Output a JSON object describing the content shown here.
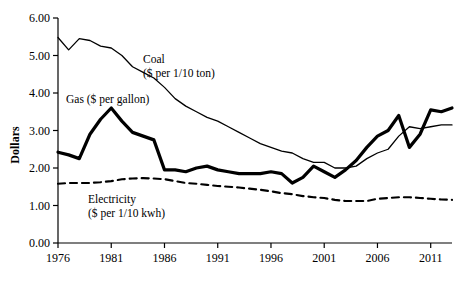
{
  "chart_data": {
    "type": "line",
    "title": "",
    "xlabel": "",
    "ylabel": "Dollars",
    "xlim": [
      1976,
      2013
    ],
    "ylim": [
      0.0,
      6.0
    ],
    "grid": false,
    "legend_position": "inline-annotations",
    "x_ticks": [
      "1976",
      "1981",
      "1986",
      "1991",
      "1996",
      "2001",
      "2006",
      "2011"
    ],
    "x_tick_values": [
      1976,
      1981,
      1986,
      1991,
      1996,
      2001,
      2006,
      2011
    ],
    "y_ticks": [
      "0.00",
      "1.00",
      "2.00",
      "3.00",
      "4.00",
      "5.00",
      "6.00"
    ],
    "y_tick_values": [
      0.0,
      1.0,
      2.0,
      3.0,
      4.0,
      5.0,
      6.0
    ],
    "x": [
      1976,
      1977,
      1978,
      1979,
      1980,
      1981,
      1982,
      1983,
      1984,
      1985,
      1986,
      1987,
      1988,
      1989,
      1990,
      1991,
      1992,
      1993,
      1994,
      1995,
      1996,
      1997,
      1998,
      1999,
      2000,
      2001,
      2002,
      2003,
      2004,
      2005,
      2006,
      2007,
      2008,
      2009,
      2010,
      2011,
      2012,
      2013
    ],
    "series": [
      {
        "name": "Coal",
        "label": "Coal",
        "label_line2": "($ per 1/10 ton)",
        "style": "thin-solid",
        "color": "#000000",
        "values": [
          5.48,
          5.15,
          5.45,
          5.4,
          5.25,
          5.2,
          5.0,
          4.7,
          4.55,
          4.4,
          4.15,
          3.85,
          3.65,
          3.5,
          3.35,
          3.25,
          3.1,
          2.95,
          2.8,
          2.65,
          2.55,
          2.45,
          2.4,
          2.25,
          2.15,
          2.15,
          2.0,
          2.0,
          2.05,
          2.25,
          2.4,
          2.5,
          2.85,
          3.1,
          3.05,
          3.1,
          3.15,
          3.15
        ]
      },
      {
        "name": "Gas",
        "label": "Gas ($ per gallon)",
        "style": "thick-solid",
        "color": "#000000",
        "values": [
          2.42,
          2.35,
          2.25,
          2.9,
          3.3,
          3.6,
          3.25,
          2.95,
          2.85,
          2.75,
          1.95,
          1.95,
          1.9,
          2.0,
          2.05,
          1.95,
          1.9,
          1.85,
          1.85,
          1.85,
          1.9,
          1.85,
          1.6,
          1.75,
          2.05,
          1.9,
          1.75,
          1.95,
          2.2,
          2.55,
          2.85,
          3.0,
          3.4,
          2.55,
          2.9,
          3.55,
          3.5,
          3.6
        ]
      },
      {
        "name": "Electricity",
        "label": "Electricity",
        "label_line2": "($ per 1/10 kwh)",
        "style": "dashed",
        "color": "#000000",
        "values": [
          1.58,
          1.6,
          1.6,
          1.6,
          1.62,
          1.65,
          1.7,
          1.72,
          1.73,
          1.72,
          1.7,
          1.65,
          1.6,
          1.58,
          1.55,
          1.52,
          1.5,
          1.48,
          1.45,
          1.42,
          1.38,
          1.33,
          1.3,
          1.25,
          1.22,
          1.2,
          1.15,
          1.12,
          1.12,
          1.12,
          1.18,
          1.2,
          1.22,
          1.22,
          1.2,
          1.18,
          1.16,
          1.15
        ]
      }
    ]
  }
}
